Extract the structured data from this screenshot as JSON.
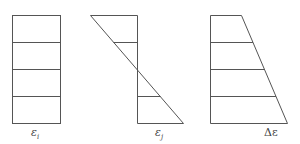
{
  "diagram": {
    "stroke_color": "#555555",
    "panels": [
      {
        "name": "uniform-strain",
        "label_main": "ε",
        "label_sub": "i",
        "shape": "rectangle",
        "divisions": 4
      },
      {
        "name": "linear-strain",
        "label_main": "ε",
        "label_sub": "j",
        "shape": "antisymmetric-triangle",
        "divisions": 4
      },
      {
        "name": "strain-difference",
        "label_main": "Δε",
        "label_sub": "",
        "shape": "trapezoid",
        "divisions": 4
      }
    ]
  }
}
